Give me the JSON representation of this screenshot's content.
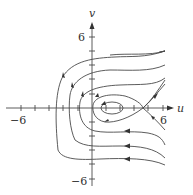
{
  "figure": {
    "type": "phase-portrait",
    "axes": {
      "x_label": "u",
      "y_label": "v",
      "x_range": [
        -6,
        6
      ],
      "y_range": [
        -6,
        6
      ],
      "x_tick_labels": {
        "neg": "−6",
        "pos": "6"
      },
      "y_tick_labels": {
        "pos": "6",
        "neg": "−6"
      }
    },
    "equilibria": [
      {
        "kind": "center",
        "u": 2,
        "v": 0
      },
      {
        "kind": "saddle",
        "u": 5,
        "v": 0
      }
    ],
    "trajectory_color": "#4a4a4a"
  }
}
